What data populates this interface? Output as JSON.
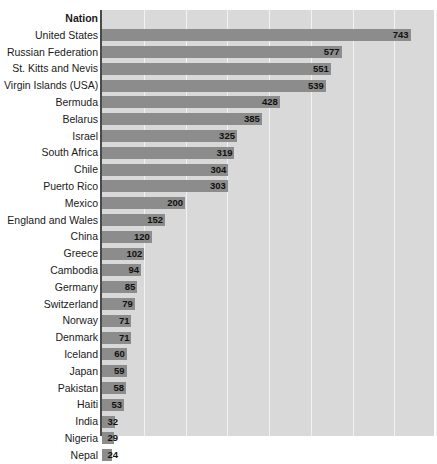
{
  "chart_data": {
    "type": "bar",
    "orientation": "horizontal",
    "title": "",
    "subtitle": "",
    "xlabel": "",
    "ylabel": "Nation",
    "header_label": "Nation",
    "grid": true,
    "gridlines": 8,
    "legend": "none",
    "xlim": [
      0,
      800
    ],
    "categories": [
      "United States",
      "Russian Federation",
      "St. Kitts and Nevis",
      "Virgin Islands (USA)",
      "Bermuda",
      "Belarus",
      "Israel",
      "South Africa",
      "Chile",
      "Puerto Rico",
      "Mexico",
      "England and Wales",
      "China",
      "Greece",
      "Cambodia",
      "Germany",
      "Switzerland",
      "Norway",
      "Denmark",
      "Iceland",
      "Japan",
      "Pakistan",
      "Haiti",
      "India",
      "Nigeria",
      "Nepal"
    ],
    "values": [
      743,
      577,
      551,
      539,
      428,
      385,
      325,
      319,
      304,
      303,
      200,
      152,
      120,
      102,
      94,
      85,
      79,
      71,
      71,
      60,
      59,
      58,
      53,
      32,
      29,
      24
    ],
    "colors": {
      "bar": "#8c8c8c",
      "plot_background": "#d9d9d9",
      "gridline": "#f2f2f2",
      "axis": "#4a4a4a",
      "label_text": "#1a1a1a",
      "value_text": "#111111",
      "page_background": "#ffffff"
    }
  }
}
